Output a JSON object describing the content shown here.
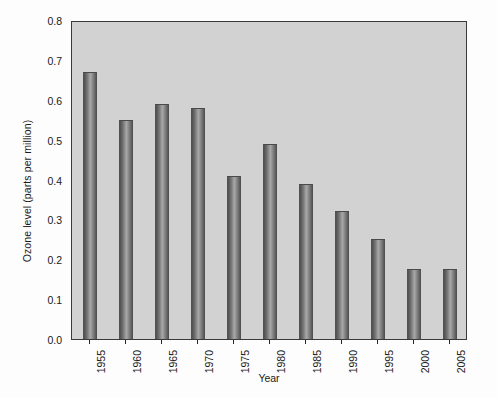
{
  "chart_data": {
    "type": "bar",
    "title": "",
    "xlabel": "Year",
    "ylabel": "Ozone level (parts per million)",
    "categories": [
      "1955",
      "1960",
      "1965",
      "1970",
      "1975",
      "1980",
      "1985",
      "1990",
      "1995",
      "2000",
      "2005"
    ],
    "values": [
      0.67,
      0.55,
      0.59,
      0.58,
      0.41,
      0.49,
      0.39,
      0.32,
      0.25,
      0.175,
      0.175
    ],
    "ylim": [
      0.0,
      0.8
    ],
    "ytick_labels": [
      "0.0",
      "0.1",
      "0.2",
      "0.3",
      "0.4",
      "0.5",
      "0.6",
      "0.7",
      "0.8"
    ],
    "ytick_values": [
      0.0,
      0.1,
      0.2,
      0.3,
      0.4,
      0.5,
      0.6,
      0.7,
      0.8
    ],
    "grid": false,
    "legend": null,
    "plot_background_color": "#d2d2d2",
    "bar_color": "#7a7a7a",
    "axis_color": "#3a3a3a"
  }
}
